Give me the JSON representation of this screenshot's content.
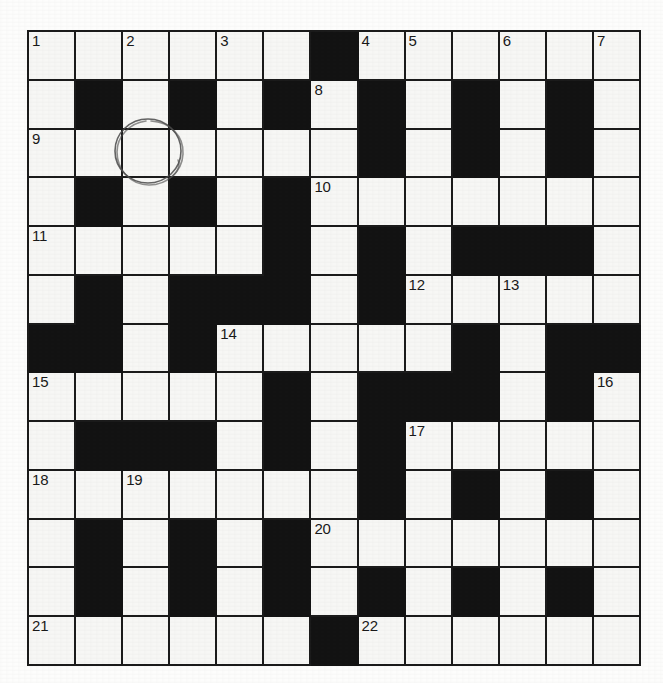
{
  "document": {
    "type": "crossword-puzzle-grid",
    "title": "Crossword Grid",
    "rows": 13,
    "columns": 13,
    "colors": {
      "block": "#131313",
      "cell": "#f7f7f5",
      "grid_line": "#1b1b1b",
      "page_background": "#fdfdfc",
      "ink": "#4a4a4a"
    }
  },
  "grid": {
    "legend": {
      "white": "open letter cell",
      "block": "blocked cell"
    },
    "cells": [
      [
        {
          "t": "white",
          "n": "1"
        },
        {
          "t": "white",
          "n": ""
        },
        {
          "t": "white",
          "n": "2"
        },
        {
          "t": "white",
          "n": ""
        },
        {
          "t": "white",
          "n": "3"
        },
        {
          "t": "white",
          "n": ""
        },
        {
          "t": "block",
          "n": ""
        },
        {
          "t": "white",
          "n": "4"
        },
        {
          "t": "white",
          "n": "5"
        },
        {
          "t": "white",
          "n": ""
        },
        {
          "t": "white",
          "n": "6"
        },
        {
          "t": "white",
          "n": ""
        },
        {
          "t": "white",
          "n": "7"
        }
      ],
      [
        {
          "t": "white",
          "n": ""
        },
        {
          "t": "block",
          "n": ""
        },
        {
          "t": "white",
          "n": ""
        },
        {
          "t": "block",
          "n": ""
        },
        {
          "t": "white",
          "n": ""
        },
        {
          "t": "block",
          "n": ""
        },
        {
          "t": "white",
          "n": "8"
        },
        {
          "t": "block",
          "n": ""
        },
        {
          "t": "white",
          "n": ""
        },
        {
          "t": "block",
          "n": ""
        },
        {
          "t": "white",
          "n": ""
        },
        {
          "t": "block",
          "n": ""
        },
        {
          "t": "white",
          "n": ""
        }
      ],
      [
        {
          "t": "white",
          "n": "9"
        },
        {
          "t": "white",
          "n": ""
        },
        {
          "t": "white",
          "n": ""
        },
        {
          "t": "white",
          "n": ""
        },
        {
          "t": "white",
          "n": ""
        },
        {
          "t": "white",
          "n": ""
        },
        {
          "t": "white",
          "n": ""
        },
        {
          "t": "block",
          "n": ""
        },
        {
          "t": "white",
          "n": ""
        },
        {
          "t": "block",
          "n": ""
        },
        {
          "t": "white",
          "n": ""
        },
        {
          "t": "block",
          "n": ""
        },
        {
          "t": "white",
          "n": ""
        }
      ],
      [
        {
          "t": "white",
          "n": ""
        },
        {
          "t": "block",
          "n": ""
        },
        {
          "t": "white",
          "n": ""
        },
        {
          "t": "block",
          "n": ""
        },
        {
          "t": "white",
          "n": ""
        },
        {
          "t": "block",
          "n": ""
        },
        {
          "t": "white",
          "n": "10"
        },
        {
          "t": "white",
          "n": ""
        },
        {
          "t": "white",
          "n": ""
        },
        {
          "t": "white",
          "n": ""
        },
        {
          "t": "white",
          "n": ""
        },
        {
          "t": "white",
          "n": ""
        },
        {
          "t": "white",
          "n": ""
        }
      ],
      [
        {
          "t": "white",
          "n": "11"
        },
        {
          "t": "white",
          "n": ""
        },
        {
          "t": "white",
          "n": ""
        },
        {
          "t": "white",
          "n": ""
        },
        {
          "t": "white",
          "n": ""
        },
        {
          "t": "block",
          "n": ""
        },
        {
          "t": "white",
          "n": ""
        },
        {
          "t": "block",
          "n": ""
        },
        {
          "t": "white",
          "n": ""
        },
        {
          "t": "block",
          "n": ""
        },
        {
          "t": "block",
          "n": ""
        },
        {
          "t": "block",
          "n": ""
        },
        {
          "t": "white",
          "n": ""
        }
      ],
      [
        {
          "t": "white",
          "n": ""
        },
        {
          "t": "block",
          "n": ""
        },
        {
          "t": "white",
          "n": ""
        },
        {
          "t": "block",
          "n": ""
        },
        {
          "t": "block",
          "n": ""
        },
        {
          "t": "block",
          "n": ""
        },
        {
          "t": "white",
          "n": ""
        },
        {
          "t": "block",
          "n": ""
        },
        {
          "t": "white",
          "n": "12"
        },
        {
          "t": "white",
          "n": ""
        },
        {
          "t": "white",
          "n": "13"
        },
        {
          "t": "white",
          "n": ""
        },
        {
          "t": "white",
          "n": ""
        }
      ],
      [
        {
          "t": "block",
          "n": ""
        },
        {
          "t": "block",
          "n": ""
        },
        {
          "t": "white",
          "n": ""
        },
        {
          "t": "block",
          "n": ""
        },
        {
          "t": "white",
          "n": "14"
        },
        {
          "t": "white",
          "n": ""
        },
        {
          "t": "white",
          "n": ""
        },
        {
          "t": "white",
          "n": ""
        },
        {
          "t": "white",
          "n": ""
        },
        {
          "t": "block",
          "n": ""
        },
        {
          "t": "white",
          "n": ""
        },
        {
          "t": "block",
          "n": ""
        },
        {
          "t": "block",
          "n": ""
        }
      ],
      [
        {
          "t": "white",
          "n": "15"
        },
        {
          "t": "white",
          "n": ""
        },
        {
          "t": "white",
          "n": ""
        },
        {
          "t": "white",
          "n": ""
        },
        {
          "t": "white",
          "n": ""
        },
        {
          "t": "block",
          "n": ""
        },
        {
          "t": "white",
          "n": ""
        },
        {
          "t": "block",
          "n": ""
        },
        {
          "t": "block",
          "n": ""
        },
        {
          "t": "block",
          "n": ""
        },
        {
          "t": "white",
          "n": ""
        },
        {
          "t": "block",
          "n": ""
        },
        {
          "t": "white",
          "n": "16"
        }
      ],
      [
        {
          "t": "white",
          "n": ""
        },
        {
          "t": "block",
          "n": ""
        },
        {
          "t": "block",
          "n": ""
        },
        {
          "t": "block",
          "n": ""
        },
        {
          "t": "white",
          "n": ""
        },
        {
          "t": "block",
          "n": ""
        },
        {
          "t": "white",
          "n": ""
        },
        {
          "t": "block",
          "n": ""
        },
        {
          "t": "white",
          "n": "17"
        },
        {
          "t": "white",
          "n": ""
        },
        {
          "t": "white",
          "n": ""
        },
        {
          "t": "white",
          "n": ""
        },
        {
          "t": "white",
          "n": ""
        }
      ],
      [
        {
          "t": "white",
          "n": "18"
        },
        {
          "t": "white",
          "n": ""
        },
        {
          "t": "white",
          "n": "19"
        },
        {
          "t": "white",
          "n": ""
        },
        {
          "t": "white",
          "n": ""
        },
        {
          "t": "white",
          "n": ""
        },
        {
          "t": "white",
          "n": ""
        },
        {
          "t": "block",
          "n": ""
        },
        {
          "t": "white",
          "n": ""
        },
        {
          "t": "block",
          "n": ""
        },
        {
          "t": "white",
          "n": ""
        },
        {
          "t": "block",
          "n": ""
        },
        {
          "t": "white",
          "n": ""
        }
      ],
      [
        {
          "t": "white",
          "n": ""
        },
        {
          "t": "block",
          "n": ""
        },
        {
          "t": "white",
          "n": ""
        },
        {
          "t": "block",
          "n": ""
        },
        {
          "t": "white",
          "n": ""
        },
        {
          "t": "block",
          "n": ""
        },
        {
          "t": "white",
          "n": "20"
        },
        {
          "t": "white",
          "n": ""
        },
        {
          "t": "white",
          "n": ""
        },
        {
          "t": "white",
          "n": ""
        },
        {
          "t": "white",
          "n": ""
        },
        {
          "t": "white",
          "n": ""
        },
        {
          "t": "white",
          "n": ""
        }
      ],
      [
        {
          "t": "white",
          "n": ""
        },
        {
          "t": "block",
          "n": ""
        },
        {
          "t": "white",
          "n": ""
        },
        {
          "t": "block",
          "n": ""
        },
        {
          "t": "white",
          "n": ""
        },
        {
          "t": "block",
          "n": ""
        },
        {
          "t": "white",
          "n": ""
        },
        {
          "t": "block",
          "n": ""
        },
        {
          "t": "white",
          "n": ""
        },
        {
          "t": "block",
          "n": ""
        },
        {
          "t": "white",
          "n": ""
        },
        {
          "t": "block",
          "n": ""
        },
        {
          "t": "white",
          "n": ""
        }
      ],
      [
        {
          "t": "white",
          "n": "21"
        },
        {
          "t": "white",
          "n": ""
        },
        {
          "t": "white",
          "n": ""
        },
        {
          "t": "white",
          "n": ""
        },
        {
          "t": "white",
          "n": ""
        },
        {
          "t": "white",
          "n": ""
        },
        {
          "t": "block",
          "n": ""
        },
        {
          "t": "white",
          "n": "22"
        },
        {
          "t": "white",
          "n": ""
        },
        {
          "t": "white",
          "n": ""
        },
        {
          "t": "white",
          "n": ""
        },
        {
          "t": "white",
          "n": ""
        },
        {
          "t": "white",
          "n": ""
        }
      ]
    ]
  },
  "annotations": [
    {
      "name": "hand-drawn-circle",
      "shape": "circle",
      "description": "hand drawn pencil circle over grid area near row 3 column 3",
      "center_x": 148,
      "center_y": 151,
      "radius": 32,
      "color": "#4a4a4a"
    }
  ],
  "clue_numbers": [
    "1",
    "2",
    "3",
    "4",
    "5",
    "6",
    "7",
    "8",
    "9",
    "10",
    "11",
    "12",
    "13",
    "14",
    "15",
    "16",
    "17",
    "18",
    "19",
    "20",
    "21",
    "22"
  ]
}
